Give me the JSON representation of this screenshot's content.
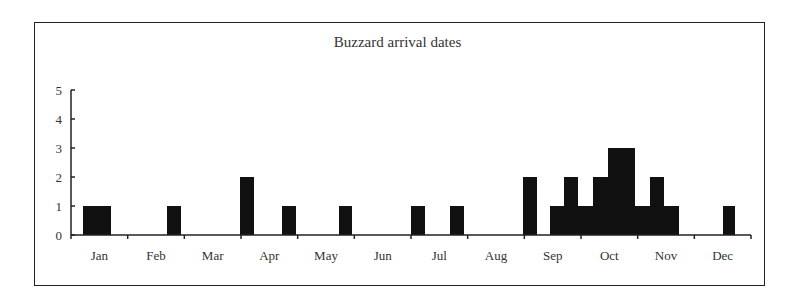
{
  "chart_data": {
    "type": "bar",
    "title": "Buzzard arrival dates",
    "xlabel": "",
    "ylabel": "",
    "ylim": [
      0,
      5
    ],
    "yticks": [
      0,
      1,
      2,
      3,
      4,
      5
    ],
    "xtick_labels": [
      "Jan",
      "Feb",
      "Mar",
      "Apr",
      "May",
      "Jun",
      "Jul",
      "Aug",
      "Sep",
      "Oct",
      "Nov",
      "Dec"
    ],
    "grid": false,
    "legend": null,
    "bar_color": "#111111",
    "bars": [
      {
        "period": "early Jan (a)",
        "value": 1
      },
      {
        "period": "early Jan (b)",
        "value": 1
      },
      {
        "period": "late Feb",
        "value": 1
      },
      {
        "period": "late Mar",
        "value": 2
      },
      {
        "period": "mid Apr",
        "value": 1
      },
      {
        "period": "mid May",
        "value": 1
      },
      {
        "period": "late Jun",
        "value": 1
      },
      {
        "period": "mid Jul",
        "value": 1
      },
      {
        "period": "late Aug",
        "value": 2
      },
      {
        "period": "early Sep",
        "value": 1
      },
      {
        "period": "mid Sep",
        "value": 2
      },
      {
        "period": "late Sep",
        "value": 1
      },
      {
        "period": "early Oct",
        "value": 2
      },
      {
        "period": "mid Oct",
        "value": 3
      },
      {
        "period": "late Oct",
        "value": 3
      },
      {
        "period": "end Oct",
        "value": 1
      },
      {
        "period": "early Nov",
        "value": 2
      },
      {
        "period": "mid Nov",
        "value": 1
      },
      {
        "period": "mid Dec",
        "value": 1
      }
    ]
  },
  "bar_geometry": [
    {
      "x": 83,
      "w": 14,
      "v": 1
    },
    {
      "x": 97,
      "w": 14,
      "v": 1
    },
    {
      "x": 167,
      "w": 14,
      "v": 1
    },
    {
      "x": 240,
      "w": 14,
      "v": 2
    },
    {
      "x": 282,
      "w": 14,
      "v": 1
    },
    {
      "x": 339,
      "w": 13,
      "v": 1
    },
    {
      "x": 411,
      "w": 14,
      "v": 1
    },
    {
      "x": 450,
      "w": 14,
      "v": 1
    },
    {
      "x": 523,
      "w": 14,
      "v": 2
    },
    {
      "x": 550,
      "w": 14,
      "v": 1
    },
    {
      "x": 564,
      "w": 14,
      "v": 2
    },
    {
      "x": 578,
      "w": 15,
      "v": 1
    },
    {
      "x": 593,
      "w": 15,
      "v": 2
    },
    {
      "x": 608,
      "w": 14,
      "v": 3
    },
    {
      "x": 622,
      "w": 13,
      "v": 3
    },
    {
      "x": 635,
      "w": 15,
      "v": 1
    },
    {
      "x": 650,
      "w": 14,
      "v": 2
    },
    {
      "x": 664,
      "w": 15,
      "v": 1
    },
    {
      "x": 723,
      "w": 12,
      "v": 1
    }
  ]
}
